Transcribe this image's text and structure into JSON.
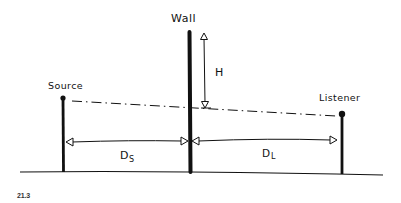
{
  "diagram": {
    "labels": {
      "wall": "Wall",
      "source": "Source",
      "listener": "Listener",
      "height": "H",
      "source_distance_main": "D",
      "source_distance_sub": "S",
      "listener_distance_main": "D",
      "listener_distance_sub": "L"
    },
    "figure_number": "21.3",
    "colors": {
      "ink": "#111111",
      "background": "#ffffff"
    }
  }
}
